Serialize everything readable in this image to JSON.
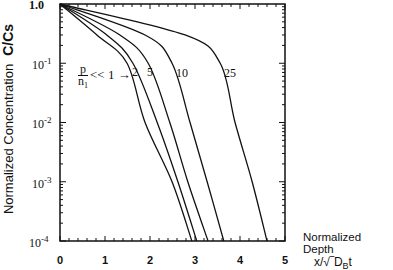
{
  "chart_data": {
    "type": "line",
    "title": "",
    "xlabel": "Normalized Depth",
    "xlabel_var": "x/√D_B t",
    "ylabel": "Normalized Concentration",
    "ylabel_var": "C/Cs",
    "xscale": "linear",
    "yscale": "log",
    "xlim": [
      0,
      5
    ],
    "ylim": [
      0.0001,
      1.0
    ],
    "x_ticks": [
      "0",
      "1",
      "2",
      "3",
      "4",
      "5"
    ],
    "y_ticks": [
      "1.0",
      "10^-1",
      "10^-2",
      "10^-3",
      "10^-4"
    ],
    "grid": false,
    "legend": "inline labels",
    "parameter_label": "p/n1",
    "series": [
      {
        "name": "p/n1 << 1",
        "points": [
          [
            0,
            1.0
          ],
          [
            0.82,
            0.3
          ],
          [
            1.49,
            0.1
          ],
          [
            1.89,
            0.01
          ],
          [
            2.49,
            0.001
          ],
          [
            2.93,
            0.0001
          ]
        ]
      },
      {
        "name": "2",
        "points": [
          [
            0,
            1.0
          ],
          [
            1.04,
            0.3
          ],
          [
            1.62,
            0.1
          ],
          [
            2.16,
            0.01
          ],
          [
            2.62,
            0.001
          ],
          [
            3.04,
            0.0001
          ]
        ]
      },
      {
        "name": "5",
        "points": [
          [
            0,
            1.0
          ],
          [
            1.33,
            0.3
          ],
          [
            1.96,
            0.1
          ],
          [
            2.44,
            0.01
          ],
          [
            2.84,
            0.001
          ],
          [
            3.29,
            0.0001
          ]
        ]
      },
      {
        "name": "10",
        "points": [
          [
            0,
            1.0
          ],
          [
            1.89,
            0.3
          ],
          [
            2.49,
            0.1
          ],
          [
            2.89,
            0.01
          ],
          [
            3.27,
            0.001
          ],
          [
            3.64,
            0.0001
          ]
        ]
      },
      {
        "name": "25",
        "points": [
          [
            0,
            1.0
          ],
          [
            2.78,
            0.3
          ],
          [
            3.56,
            0.1
          ],
          [
            3.89,
            0.01
          ],
          [
            4.27,
            0.001
          ],
          [
            4.6,
            0.0001
          ]
        ]
      }
    ]
  },
  "labels": {
    "ylabel": "Normalized  Concentration",
    "ylabel_var": "C/Cs",
    "xlabel": "Normalized Depth",
    "xvar": "x/√‾D",
    "xvar_sub": "B",
    "xvar_end": "t",
    "y_1": "1.0",
    "y_m1": "10",
    "y_m2": "10",
    "y_m3": "10",
    "y_m4": "10",
    "e_m1": "-1",
    "e_m2": "-2",
    "e_m3": "-3",
    "e_m4": "-4",
    "x0": "0",
    "x1": "1",
    "x2": "2",
    "x3": "3",
    "x4": "4",
    "x5": "5",
    "p": "p",
    "n1": "n",
    "n1_sub": "1",
    "ll1": "<< 1 →",
    "c2": "2",
    "c5": "5",
    "c10": "10",
    "c25": "25"
  }
}
